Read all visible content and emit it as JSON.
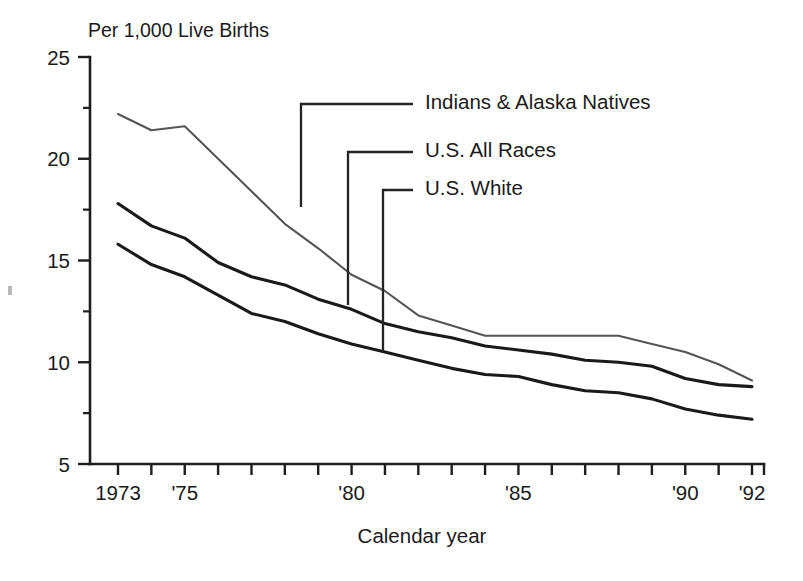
{
  "chart_data": {
    "type": "line",
    "title": "",
    "subtitle": "Per 1,000 Live Births",
    "xlabel": "Calendar year",
    "ylabel": "",
    "unit_note": "Per 1,000 Live Births",
    "x": [
      1973,
      1974,
      1975,
      1976,
      1977,
      1978,
      1979,
      1980,
      1981,
      1982,
      1983,
      1984,
      1985,
      1986,
      1987,
      1988,
      1989,
      1990,
      1991,
      1992
    ],
    "xlim": [
      1973,
      1992
    ],
    "ylim": [
      5,
      25
    ],
    "grid": false,
    "legend_position": "inside-upper-right-with-leader-lines",
    "x_tick_labels": [
      {
        "x": 1973,
        "label": "1973"
      },
      {
        "x": 1975,
        "label": "'75"
      },
      {
        "x": 1980,
        "label": "'80"
      },
      {
        "x": 1985,
        "label": "'85"
      },
      {
        "x": 1990,
        "label": "'90"
      },
      {
        "x": 1992,
        "label": "'92"
      }
    ],
    "y_major_ticks": [
      5,
      10,
      15,
      20,
      25
    ],
    "y_major_tick_labels": [
      "5",
      "10",
      "15",
      "20",
      "25"
    ],
    "y_minor_ticks": [
      7.5,
      12.5,
      17.5,
      22.5
    ],
    "series": [
      {
        "name": "Indians & Alaska Natives",
        "color": "#555555",
        "values": [
          22.2,
          21.4,
          21.6,
          20.0,
          18.4,
          16.8,
          15.6,
          14.3,
          13.5,
          12.3,
          11.8,
          11.3,
          11.3,
          11.3,
          11.3,
          11.3,
          10.9,
          10.5,
          9.9,
          9.1
        ]
      },
      {
        "name": "U.S. All Races",
        "color": "#1a1a1a",
        "values": [
          17.8,
          16.7,
          16.1,
          14.9,
          14.2,
          13.8,
          13.1,
          12.6,
          11.9,
          11.5,
          11.2,
          10.8,
          10.6,
          10.4,
          10.1,
          10.0,
          9.8,
          9.2,
          8.9,
          8.8
        ]
      },
      {
        "name": "U.S. White",
        "color": "#1a1a1a",
        "values": [
          15.8,
          14.8,
          14.2,
          13.3,
          12.4,
          12.0,
          11.4,
          10.9,
          10.5,
          10.1,
          9.7,
          9.4,
          9.3,
          8.9,
          8.6,
          8.5,
          8.2,
          7.7,
          7.4,
          7.2
        ]
      }
    ],
    "annotations": [
      {
        "label": "Indians & Alaska Natives",
        "leader_from_year": 1978,
        "leader_to_value": 18.4
      },
      {
        "label": "U.S. All Races",
        "leader_from_year": 1979.5,
        "leader_to_value": 12.9
      },
      {
        "label": "U.S. White",
        "leader_from_year": 1980.7,
        "leader_to_value": 10.75
      }
    ]
  },
  "legend": {
    "items": [
      {
        "label": "Indians & Alaska Natives"
      },
      {
        "label": "U.S. All Races"
      },
      {
        "label": "U.S. White"
      }
    ]
  },
  "axes": {
    "unit_caption": "Per 1,000 Live Births",
    "x_axis_title": "Calendar year"
  }
}
